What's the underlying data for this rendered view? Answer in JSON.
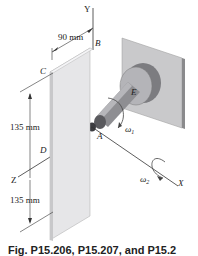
{
  "figure": {
    "labels": {
      "y_axis": "Y",
      "x_axis": "X",
      "z_axis": "Z",
      "point_a": "A",
      "point_b": "B",
      "point_c": "C",
      "point_d": "D",
      "point_e": "E",
      "omega1": "ω",
      "omega1_sub": "1",
      "omega2": "ω",
      "omega2_sub": "2"
    },
    "dimensions": {
      "width": "90 mm",
      "upper_height": "135 mm",
      "lower_height": "135 mm"
    },
    "caption": "Fig. P15.206, P15.207, and P15.2"
  }
}
